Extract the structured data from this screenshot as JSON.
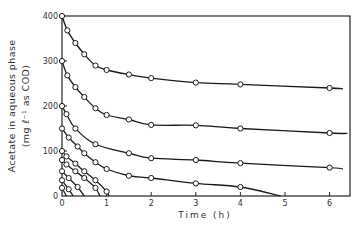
{
  "chart_data": {
    "type": "scatter",
    "title": "",
    "xlabel": "Time (h)",
    "ylabel_line1": "Acetate in aqueous phase",
    "ylabel_line2": "(mg ℓ⁻¹ as COD)",
    "xlim": [
      0,
      6.4
    ],
    "ylim": [
      0,
      400
    ],
    "x_ticks": [
      0,
      1,
      2,
      3,
      4,
      5,
      6
    ],
    "y_ticks": [
      0,
      100,
      200,
      300,
      400
    ],
    "x_tick_labels": [
      "0",
      "1",
      "2",
      "3",
      "4",
      "5",
      "6"
    ],
    "y_tick_labels": [
      "0",
      "100",
      "200",
      "300",
      "400"
    ],
    "grid": false,
    "legend": null,
    "marker": "open-circle",
    "series": [
      {
        "name": "C0=400",
        "x": [
          0,
          0.12,
          0.3,
          0.5,
          0.75,
          1.0,
          1.5,
          2.0,
          3.0,
          4.0,
          6.0
        ],
        "y": [
          400,
          368,
          340,
          315,
          290,
          280,
          270,
          262,
          252,
          248,
          240
        ]
      },
      {
        "name": "C0=300",
        "x": [
          0,
          0.12,
          0.3,
          0.5,
          0.75,
          1.0,
          1.5,
          2.0,
          3.0,
          4.0,
          6.0
        ],
        "y": [
          300,
          268,
          242,
          220,
          195,
          180,
          170,
          158,
          157,
          150,
          140
        ]
      },
      {
        "name": "C0=200",
        "x": [
          0,
          0.1,
          0.3,
          0.75,
          1.5,
          2.0,
          3.0,
          4.0,
          6.0
        ],
        "y": [
          200,
          182,
          150,
          115,
          95,
          84,
          80,
          73,
          63
        ]
      },
      {
        "name": "C0=150",
        "x": [
          0,
          0.15,
          0.35,
          0.5,
          0.75,
          1.0,
          1.5,
          2.0,
          3.0,
          4.0
        ],
        "y": [
          150,
          130,
          110,
          95,
          75,
          60,
          45,
          40,
          28,
          20
        ]
      },
      {
        "name": "C0=100",
        "x": [
          0,
          0.1,
          0.3,
          0.5,
          0.75,
          1.0,
          1.05
        ],
        "y": [
          100,
          88,
          72,
          55,
          35,
          10,
          0
        ]
      },
      {
        "name": "C0=80",
        "x": [
          0,
          0.1,
          0.3,
          0.5,
          0.75,
          0.85
        ],
        "y": [
          80,
          70,
          55,
          40,
          18,
          0
        ]
      },
      {
        "name": "C0=55",
        "x": [
          0,
          0.15,
          0.35,
          0.5
        ],
        "y": [
          55,
          40,
          20,
          0
        ]
      },
      {
        "name": "C0=35",
        "x": [
          0,
          0.15,
          0.25
        ],
        "y": [
          35,
          15,
          0
        ]
      },
      {
        "name": "C0=18",
        "x": [
          0,
          0.1
        ],
        "y": [
          18,
          0
        ]
      }
    ],
    "fit_curves_note": "Smooth solid lines through each series; C0=150 curve reaches ~0 at t≈4.9 h"
  }
}
